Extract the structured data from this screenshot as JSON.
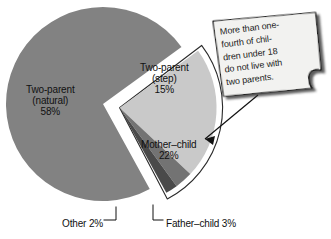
{
  "figure": {
    "title": "",
    "background_color": "#ffffff"
  },
  "callout": {
    "name": "sticky-note-callout",
    "lines": [
      "More than one-",
      "fourth of chil-",
      "dren under 18",
      "do not live with",
      "two parents."
    ],
    "full_text": "More than one-fourth of children under 18 do not live with two parents.",
    "paper_color": "#f2f2f0",
    "border_color": "#1a1a1a",
    "shadow_color": "#3a3a3a",
    "arrow_color": "#111111",
    "points_to": "exploded-single-parent-group"
  },
  "chart_data": {
    "type": "pie",
    "title": "",
    "subtitle": "",
    "xlabel": "",
    "ylabel": "",
    "legend_position": "none",
    "grid": false,
    "units": "percent",
    "total": 100,
    "start_angle_deg": -90,
    "direction": "clockwise",
    "exploded_group": [
      "Mother-child",
      "Father-child",
      "Other"
    ],
    "categories": [
      "Two-parent (step)",
      "Mother-child",
      "Father-child",
      "Other",
      "Two-parent (natural)"
    ],
    "values": [
      15,
      22,
      3,
      2,
      58
    ],
    "slices": [
      {
        "label_line1": "Two-parent",
        "label_line2": "(step)",
        "label_value": "15%",
        "name": "Two-parent (step)",
        "value": 15,
        "color": "#828282"
      },
      {
        "label_line1": "Mother-child",
        "label_line2": "",
        "label_value": "22%",
        "name": "Mother-child",
        "value": 22,
        "color": "#c9c9c9"
      },
      {
        "label_line1": "Father-child 3%",
        "label_line2": "",
        "label_value": "3%",
        "name": "Father-child",
        "value": 3,
        "color": "#737373"
      },
      {
        "label_line1": "Other 2%",
        "label_line2": "",
        "label_value": "2%",
        "name": "Other",
        "value": 2,
        "color": "#4a4a4a"
      },
      {
        "label_line1": "Two-parent",
        "label_line2": "(natural)",
        "label_value": "58%",
        "name": "Two-parent (natural)",
        "value": 58,
        "color": "#828282"
      }
    ]
  },
  "labels": {
    "natural": {
      "line1": "Two-parent",
      "line2": "(natural)",
      "pct": "58%"
    },
    "step": {
      "line1": "Two-parent",
      "line2": "(step)",
      "pct": "15%"
    },
    "mother": {
      "line1": "Mother–child",
      "pct": "22%"
    },
    "other": {
      "text": "Other 2%"
    },
    "father": {
      "text": "Father–child 3%"
    }
  }
}
